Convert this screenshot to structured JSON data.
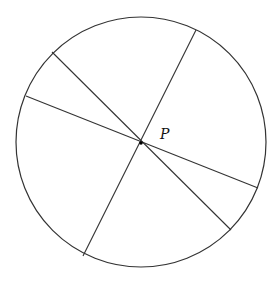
{
  "diagram": {
    "circle": {
      "cx": 141,
      "cy": 142,
      "r": 125,
      "stroke": "#333333"
    },
    "point": {
      "label": "P",
      "x": 141,
      "y": 143
    },
    "chords": [
      {
        "x1": 196,
        "y1": 30,
        "x2": 83,
        "y2": 256
      },
      {
        "x1": 52,
        "y1": 52,
        "x2": 231,
        "y2": 230
      },
      {
        "x1": 26,
        "y1": 96,
        "x2": 258,
        "y2": 188
      }
    ]
  }
}
